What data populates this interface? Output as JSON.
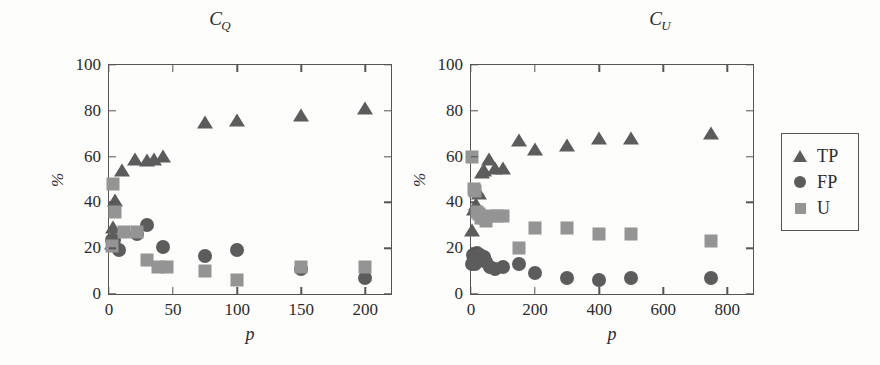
{
  "figure": {
    "background_color": "#fdfdfb",
    "series_colors": {
      "TP": "#5c5c5c",
      "FP": "#5c5c5c",
      "U": "#949494"
    },
    "axis_color": "#555555"
  },
  "legend": {
    "position": "right-outside",
    "entries": [
      {
        "label": "TP",
        "marker": "triangle",
        "color": "#5c5c5c"
      },
      {
        "label": "FP",
        "marker": "circle",
        "color": "#5c5c5c"
      },
      {
        "label": "U",
        "marker": "square",
        "color": "#949494"
      }
    ]
  },
  "panels": [
    {
      "id": "CQ",
      "title_main": "C",
      "title_sub": "Q",
      "xlabel": "p",
      "ylabel": "%"
    },
    {
      "id": "CU",
      "title_main": "C",
      "title_sub": "U",
      "xlabel": "p",
      "ylabel": "%"
    }
  ],
  "chart_data": [
    {
      "type": "scatter",
      "title": "C_Q",
      "xlabel": "p",
      "ylabel": "%",
      "xlim": [
        0,
        220
      ],
      "ylim": [
        0,
        100
      ],
      "xticks": [
        0,
        50,
        100,
        150,
        200
      ],
      "yticks": [
        0,
        20,
        40,
        60,
        80,
        100
      ],
      "grid": false,
      "series": [
        {
          "name": "TP",
          "marker": "triangle",
          "color": "#5c5c5c",
          "points": [
            {
              "x": 2,
              "y": 23
            },
            {
              "x": 3,
              "y": 30
            },
            {
              "x": 5,
              "y": 42
            },
            {
              "x": 10,
              "y": 55
            },
            {
              "x": 20,
              "y": 60
            },
            {
              "x": 30,
              "y": 59.5
            },
            {
              "x": 35,
              "y": 60
            },
            {
              "x": 42,
              "y": 61
            },
            {
              "x": 75,
              "y": 76
            },
            {
              "x": 100,
              "y": 77
            },
            {
              "x": 150,
              "y": 79
            },
            {
              "x": 200,
              "y": 82
            }
          ]
        },
        {
          "name": "FP",
          "marker": "circle",
          "color": "#5c5c5c",
          "points": [
            {
              "x": 2,
              "y": 23.5
            },
            {
              "x": 4,
              "y": 23.5
            },
            {
              "x": 8,
              "y": 19
            },
            {
              "x": 22,
              "y": 26
            },
            {
              "x": 30,
              "y": 30
            },
            {
              "x": 42,
              "y": 20.5
            },
            {
              "x": 75,
              "y": 16.5
            },
            {
              "x": 100,
              "y": 19
            },
            {
              "x": 150,
              "y": 11
            },
            {
              "x": 200,
              "y": 7
            }
          ]
        },
        {
          "name": "U",
          "marker": "square",
          "color": "#949494",
          "points": [
            {
              "x": 2,
              "y": 21
            },
            {
              "x": 3,
              "y": 48
            },
            {
              "x": 5,
              "y": 36
            },
            {
              "x": 12,
              "y": 27
            },
            {
              "x": 22,
              "y": 27
            },
            {
              "x": 30,
              "y": 15
            },
            {
              "x": 38,
              "y": 12
            },
            {
              "x": 45,
              "y": 12
            },
            {
              "x": 75,
              "y": 10
            },
            {
              "x": 100,
              "y": 6
            },
            {
              "x": 150,
              "y": 12
            },
            {
              "x": 200,
              "y": 12
            }
          ]
        }
      ]
    },
    {
      "type": "scatter",
      "title": "C_U",
      "xlabel": "p",
      "ylabel": "%",
      "xlim": [
        0,
        880
      ],
      "ylim": [
        0,
        100
      ],
      "xticks": [
        0,
        200,
        400,
        600,
        800
      ],
      "yticks": [
        0,
        20,
        40,
        60,
        80,
        100
      ],
      "grid": false,
      "series": [
        {
          "name": "TP",
          "marker": "triangle",
          "color": "#5c5c5c",
          "points": [
            {
              "x": 3,
              "y": 29
            },
            {
              "x": 8,
              "y": 38
            },
            {
              "x": 15,
              "y": 40
            },
            {
              "x": 25,
              "y": 45
            },
            {
              "x": 35,
              "y": 54
            },
            {
              "x": 42,
              "y": 55
            },
            {
              "x": 55,
              "y": 60
            },
            {
              "x": 75,
              "y": 56
            },
            {
              "x": 100,
              "y": 56
            },
            {
              "x": 150,
              "y": 68
            },
            {
              "x": 200,
              "y": 64
            },
            {
              "x": 300,
              "y": 66
            },
            {
              "x": 400,
              "y": 69
            },
            {
              "x": 500,
              "y": 69
            },
            {
              "x": 750,
              "y": 71
            }
          ]
        },
        {
          "name": "FP",
          "marker": "circle",
          "color": "#5c5c5c",
          "points": [
            {
              "x": 3,
              "y": 13
            },
            {
              "x": 6,
              "y": 17
            },
            {
              "x": 10,
              "y": 15
            },
            {
              "x": 14,
              "y": 13
            },
            {
              "x": 18,
              "y": 18
            },
            {
              "x": 22,
              "y": 16
            },
            {
              "x": 28,
              "y": 17
            },
            {
              "x": 34,
              "y": 15
            },
            {
              "x": 40,
              "y": 16
            },
            {
              "x": 48,
              "y": 14
            },
            {
              "x": 60,
              "y": 12
            },
            {
              "x": 75,
              "y": 11
            },
            {
              "x": 100,
              "y": 12
            },
            {
              "x": 150,
              "y": 13
            },
            {
              "x": 200,
              "y": 9
            },
            {
              "x": 300,
              "y": 7
            },
            {
              "x": 400,
              "y": 6
            },
            {
              "x": 500,
              "y": 7
            },
            {
              "x": 750,
              "y": 7
            }
          ]
        },
        {
          "name": "U",
          "marker": "square",
          "color": "#949494",
          "points": [
            {
              "x": 3,
              "y": 60
            },
            {
              "x": 8,
              "y": 46
            },
            {
              "x": 12,
              "y": 45
            },
            {
              "x": 18,
              "y": 36
            },
            {
              "x": 25,
              "y": 35
            },
            {
              "x": 32,
              "y": 33
            },
            {
              "x": 40,
              "y": 33
            },
            {
              "x": 48,
              "y": 32
            },
            {
              "x": 60,
              "y": 34
            },
            {
              "x": 80,
              "y": 34
            },
            {
              "x": 100,
              "y": 34
            },
            {
              "x": 150,
              "y": 20
            },
            {
              "x": 200,
              "y": 29
            },
            {
              "x": 300,
              "y": 29
            },
            {
              "x": 400,
              "y": 26
            },
            {
              "x": 500,
              "y": 26
            },
            {
              "x": 750,
              "y": 23
            }
          ]
        }
      ]
    }
  ]
}
